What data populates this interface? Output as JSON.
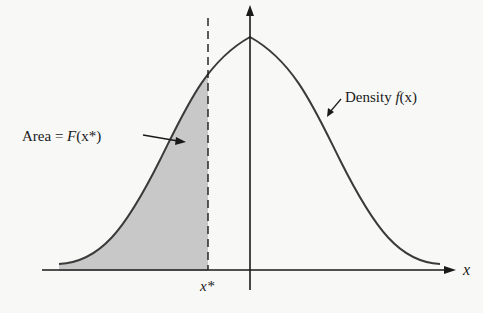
{
  "diagram": {
    "labels": {
      "area_prefix": "Area = ",
      "area_func": "F",
      "area_arg": "(x*)",
      "density_word": "Density ",
      "density_func": "f",
      "density_arg": "(x)",
      "x_star": "x*",
      "x_axis": "x"
    },
    "colors": {
      "background": "#f8f8f6",
      "shade": "#c8c8c8",
      "curve": "#3a3a3a",
      "axis": "#1a1a1a"
    }
  }
}
